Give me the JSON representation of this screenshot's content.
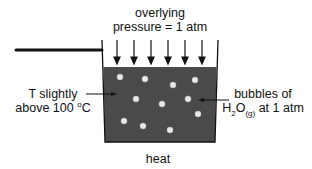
{
  "diagram": {
    "top_label": {
      "line1": "overlying",
      "line2": "pressure = 1 atm"
    },
    "left_label": {
      "line1": "T slightly",
      "line2_prefix": "above 100 ",
      "degree": "o",
      "line2_suffix": "C"
    },
    "right_label": {
      "line1": "bubbles of",
      "formula_main": "H",
      "formula_sub1": "2",
      "formula_o": "O",
      "formula_sub2": "(g)",
      "formula_suffix": " at 1 atm"
    },
    "bottom_label": "heat",
    "colors": {
      "liquid": "#4a4a4a",
      "bubble": "#e8e8e8",
      "stroke": "#111111",
      "background": "#ffffff"
    },
    "pressure_arrow_count": 6,
    "bubble_count": 11
  }
}
